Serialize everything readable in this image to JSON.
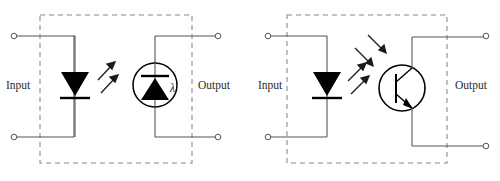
{
  "figure": {
    "background_color": "#ffffff",
    "line_color": "#555555",
    "symbol_color": "#000000",
    "dash_color": "#8a8a8a",
    "text_color": "#2b2b2b"
  },
  "diagrams": [
    {
      "id": "photodiode-optocoupler",
      "input_label": "Input",
      "output_label": "Output",
      "emitter": {
        "name": "led",
        "symbol": "light-emitting-diode",
        "direction": "down"
      },
      "detector": {
        "name": "photodiode",
        "symbol": "photodiode-in-circle",
        "direction": "up",
        "annotation": "λ"
      },
      "light_arrows": 2,
      "light_direction": "up-right",
      "terminals": [
        {
          "name": "input-top",
          "x": 14,
          "y": 36
        },
        {
          "name": "input-bottom",
          "x": 14,
          "y": 137
        },
        {
          "name": "output-top",
          "x": 218,
          "y": 36
        },
        {
          "name": "output-bottom",
          "x": 218,
          "y": 137
        }
      ]
    },
    {
      "id": "phototransistor-optocoupler",
      "input_label": "Input",
      "output_label": "Output",
      "emitter": {
        "name": "led",
        "symbol": "light-emitting-diode",
        "direction": "down"
      },
      "detector": {
        "name": "phototransistor",
        "symbol": "npn-transistor-in-circle",
        "type": "NPN"
      },
      "light_arrows": 4,
      "light_direction": "up-right-and-down-right",
      "terminals": [
        {
          "name": "input-top",
          "x": 268,
          "y": 36
        },
        {
          "name": "input-bottom",
          "x": 268,
          "y": 137
        },
        {
          "name": "output-top",
          "x": 486,
          "y": 36
        },
        {
          "name": "output-bottom",
          "x": 486,
          "y": 146
        }
      ]
    }
  ]
}
